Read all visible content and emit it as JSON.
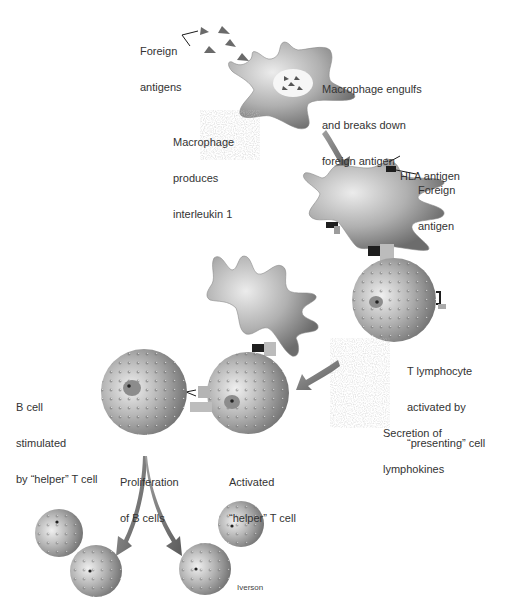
{
  "diagram": {
    "type": "immune-response-illustration",
    "colors": {
      "cell_body": "#a9a9a9",
      "cell_highlight": "#e4e4e4",
      "cell_shadow": "#6e6e6e",
      "arrow": "#777777",
      "antigen": "#666666",
      "receptor_dark": "#1e1e1e",
      "text": "#333333"
    },
    "labels": {
      "foreign_antigens": [
        "Foreign",
        "antigens"
      ],
      "macrophage_engulfs": [
        "Macrophage engulfs",
        "and breaks down",
        "foreign antigen"
      ],
      "macrophage_produces": [
        "Macrophage",
        "produces",
        "interleukin 1"
      ],
      "hla_antigen": [
        "HLA antigen"
      ],
      "foreign_antigen": [
        "Foreign",
        "antigen"
      ],
      "t_lymphocyte": [
        "T lymphocyte",
        "activated by",
        "“presenting” cell"
      ],
      "secretion": [
        "Secretion of",
        "lymphokines"
      ],
      "b_cell_stimulated": [
        "B cell",
        "stimulated",
        "by “helper” T cell"
      ],
      "proliferation": [
        "Proliferation",
        "of B cells"
      ],
      "activated_helper": [
        "Activated",
        "“helper” T cell"
      ]
    },
    "credit": "Iverson"
  }
}
